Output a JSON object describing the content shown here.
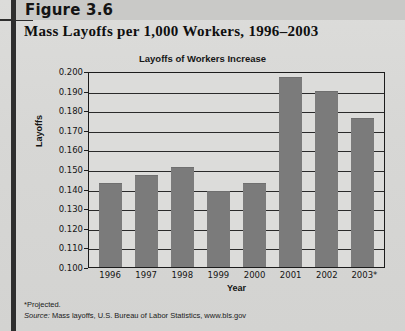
{
  "header": {
    "figure_label": "Figure 3.6",
    "subtitle": "Mass Layoffs per 1,000 Workers, 1996–2003"
  },
  "footnote": {
    "projected_note": "*Projected.",
    "source_prefix": "Source:",
    "source_text": " Mass layoffs, U.S. Bureau of Labor Statistics, www.bls.gov"
  },
  "colors": {
    "bar": "#7b7b7b",
    "axis": "#1c1c1c",
    "page_background": "#d9d9d7",
    "spine": "#2e2e2e"
  },
  "chart_data": {
    "type": "bar",
    "title": "Layoffs of Workers Increase",
    "xlabel": "Year",
    "ylabel": "Layoffs",
    "categories": [
      "1996",
      "1997",
      "1998",
      "1999",
      "2000",
      "2001",
      "2002",
      "2003*"
    ],
    "values": [
      0.143,
      0.147,
      0.151,
      0.139,
      0.143,
      0.197,
      0.19,
      0.176
    ],
    "ylim": [
      0.1,
      0.2
    ],
    "ytick_labels": [
      "0.200",
      "0.190",
      "0.180",
      "0.170",
      "0.160",
      "0.150",
      "0.140",
      "0.130",
      "0.120",
      "0.110",
      "0.100"
    ],
    "ytick_values": [
      0.2,
      0.19,
      0.18,
      0.17,
      0.16,
      0.15,
      0.14,
      0.13,
      0.12,
      0.11,
      0.1
    ],
    "grid": true,
    "legend": null
  }
}
